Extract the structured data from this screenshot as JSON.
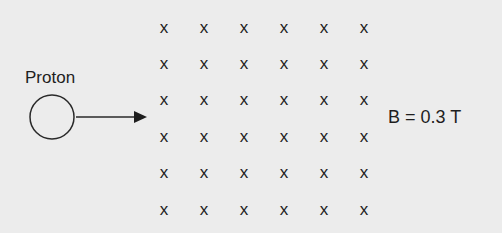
{
  "diagram": {
    "particle_label": "Proton",
    "field_label": "B = 0.3 T",
    "field_symbol": "x",
    "field_direction": "into-page",
    "grid": {
      "rows": 6,
      "cols": 6
    },
    "colors": {
      "background": "#ececec",
      "ink": "#1e1e1e"
    }
  }
}
